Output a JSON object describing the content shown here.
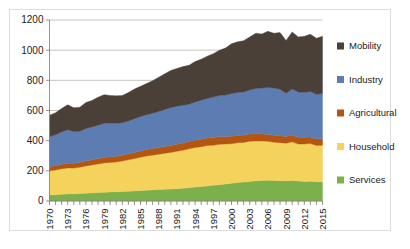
{
  "chart_data": {
    "type": "area",
    "stacked": true,
    "title": "",
    "subtitle": "",
    "xlabel": "",
    "ylabel": "",
    "ylim": [
      0,
      1200
    ],
    "yticks": [
      0,
      200,
      400,
      600,
      800,
      1000,
      1200
    ],
    "ytick_labels": [
      "0",
      "200",
      "400",
      "600",
      "800",
      "1000",
      "1200"
    ],
    "xlim": [
      1970,
      2015
    ],
    "xtick_labels": [
      "1970",
      "1973",
      "1976",
      "1979",
      "1982",
      "1985",
      "1988",
      "1991",
      "1994",
      "1997",
      "2000",
      "2003",
      "2006",
      "2009",
      "2012",
      "2015"
    ],
    "x": [
      1970,
      1971,
      1972,
      1973,
      1974,
      1975,
      1976,
      1977,
      1978,
      1979,
      1980,
      1981,
      1982,
      1983,
      1984,
      1985,
      1986,
      1987,
      1988,
      1989,
      1990,
      1991,
      1992,
      1993,
      1994,
      1995,
      1996,
      1997,
      1998,
      1999,
      2000,
      2001,
      2002,
      2003,
      2004,
      2005,
      2006,
      2007,
      2008,
      2009,
      2010,
      2011,
      2012,
      2013,
      2014,
      2015
    ],
    "grid": true,
    "legend_position": "right",
    "series": [
      {
        "name": "Services",
        "color": "#7cb04c",
        "values": [
          40,
          42,
          45,
          47,
          48,
          50,
          52,
          54,
          56,
          58,
          60,
          61,
          63,
          65,
          67,
          70,
          72,
          74,
          76,
          78,
          80,
          82,
          85,
          88,
          92,
          96,
          100,
          104,
          108,
          112,
          118,
          122,
          126,
          130,
          134,
          136,
          138,
          136,
          135,
          133,
          136,
          132,
          130,
          131,
          128,
          126
        ]
      },
      {
        "name": "Household",
        "color": "#f5d25c",
        "values": [
          160,
          163,
          168,
          172,
          170,
          174,
          180,
          184,
          190,
          194,
          196,
          198,
          202,
          208,
          214,
          220,
          226,
          230,
          234,
          238,
          242,
          248,
          252,
          258,
          262,
          264,
          268,
          266,
          268,
          266,
          262,
          264,
          262,
          266,
          264,
          262,
          258,
          254,
          252,
          250,
          256,
          246,
          248,
          250,
          240,
          244
        ]
      },
      {
        "name": "Agricultural",
        "color": "#b4560f",
        "values": [
          28,
          29,
          30,
          31,
          32,
          33,
          34,
          35,
          36,
          37,
          38,
          38,
          39,
          40,
          41,
          42,
          43,
          44,
          44,
          45,
          46,
          47,
          48,
          48,
          49,
          50,
          50,
          51,
          51,
          50,
          50,
          49,
          49,
          48,
          48,
          47,
          47,
          46,
          46,
          45,
          45,
          44,
          44,
          43,
          43,
          42
        ]
      },
      {
        "name": "Industry",
        "color": "#5d7cb2",
        "values": [
          200,
          205,
          215,
          222,
          210,
          205,
          215,
          218,
          220,
          226,
          222,
          218,
          215,
          218,
          224,
          228,
          230,
          234,
          240,
          246,
          250,
          252,
          250,
          248,
          254,
          258,
          262,
          268,
          272,
          274,
          282,
          284,
          286,
          292,
          300,
          304,
          310,
          314,
          308,
          286,
          306,
          300,
          298,
          302,
          296,
          300
        ]
      },
      {
        "name": "Mobility",
        "color": "#4a4037",
        "values": [
          140,
          146,
          156,
          166,
          158,
          160,
          172,
          176,
          186,
          190,
          184,
          182,
          180,
          188,
          196,
          200,
          208,
          216,
          226,
          236,
          248,
          250,
          256,
          258,
          268,
          272,
          280,
          288,
          300,
          312,
          330,
          336,
          340,
          352,
          366,
          358,
          372,
          362,
          376,
          350,
          378,
          366,
          372,
          380,
          372,
          380
        ]
      }
    ]
  },
  "legend": {
    "items": [
      {
        "label": "Mobility",
        "color": "#4a4037"
      },
      {
        "label": "Industry",
        "color": "#5d7cb2"
      },
      {
        "label": "Agricultural",
        "color": "#b4560f"
      },
      {
        "label": "Household",
        "color": "#f5d25c"
      },
      {
        "label": "Services",
        "color": "#7cb04c"
      }
    ]
  }
}
